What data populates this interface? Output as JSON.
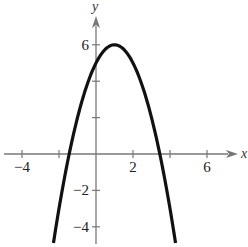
{
  "chart_data": {
    "type": "line",
    "title": "",
    "xlabel": "x",
    "ylabel": "y",
    "xlim": [
      -5,
      7.5
    ],
    "ylim": [
      -5,
      7.5
    ],
    "grid": false,
    "x_ticks": [
      -4,
      -2,
      2,
      4,
      6
    ],
    "x_tick_labels": [
      "−4",
      "",
      "2",
      "",
      "6"
    ],
    "y_ticks": [
      -4,
      -2,
      2,
      4,
      6
    ],
    "y_tick_labels": [
      "−4",
      "−2",
      "",
      "",
      "6"
    ],
    "series": [
      {
        "name": "parabola",
        "equation": "y = -(x - 1)^2 + 6",
        "x_range": [
          -2.3,
          4.3
        ],
        "color": "#111111",
        "points": [
          [
            -2.3,
            -4.89
          ],
          [
            -2,
            -3
          ],
          [
            -1.5,
            -0.25
          ],
          [
            -1.45,
            0
          ],
          [
            -1,
            2
          ],
          [
            -0.5,
            3.75
          ],
          [
            0,
            5
          ],
          [
            0.5,
            5.75
          ],
          [
            1,
            6
          ],
          [
            1.5,
            5.75
          ],
          [
            2,
            5
          ],
          [
            2.5,
            3.75
          ],
          [
            3,
            2
          ],
          [
            3.45,
            0
          ],
          [
            3.5,
            -0.25
          ],
          [
            4,
            -3
          ],
          [
            4.3,
            -4.89
          ]
        ]
      }
    ]
  }
}
